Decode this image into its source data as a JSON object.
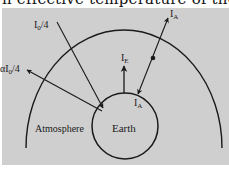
{
  "caption_fragment": "n effective temperature of the",
  "diagram": {
    "background_color": "#cfcfcf",
    "line_color": "#1a1a1a",
    "labels": {
      "incoming_solar": "I",
      "incoming_solar_sub": "0",
      "incoming_solar_suffix": "/4",
      "reflected": "αI",
      "reflected_sub": "0",
      "reflected_suffix": "/4",
      "earth_emission": "I",
      "earth_emission_sub": "E",
      "atmosphere_up": "I",
      "atmosphere_up_sub": "A",
      "atmosphere_down": "I",
      "atmosphere_down_sub": "A",
      "atmosphere": "Atmosphere",
      "earth": "Earth"
    }
  }
}
